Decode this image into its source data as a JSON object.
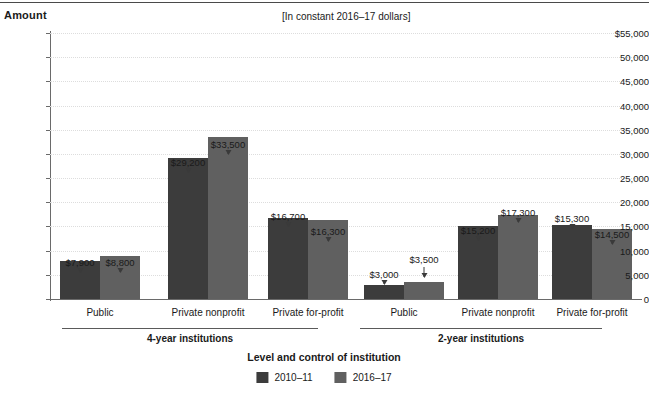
{
  "header": {
    "amount_label": "Amount",
    "units_note": "[In constant 2016–17 dollars]"
  },
  "axis_title": "Level and control of institution",
  "legend": {
    "items": [
      {
        "label": "2010–11",
        "color": "#3c3c3c"
      },
      {
        "label": "2016–17",
        "color": "#606060"
      }
    ]
  },
  "colors": {
    "series_2010_11": "#3c3c3c",
    "series_2016_17": "#606060",
    "axis": "#6a6a6a",
    "gridline": "#dddddd",
    "text": "#1a1a1a"
  },
  "chart_data": {
    "type": "bar",
    "title": "",
    "subtitle": "[In constant 2016–17 dollars]",
    "xlabel": "Level and control of institution",
    "ylabel": "Amount",
    "ylim": [
      0,
      55000
    ],
    "ytick_values": [
      0,
      5000,
      10000,
      15000,
      20000,
      25000,
      30000,
      35000,
      40000,
      45000,
      50000,
      55000
    ],
    "ytick_labels": [
      "0",
      "5,000",
      "10,000",
      "15,000",
      "20,000",
      "25,000",
      "30,000",
      "35,000",
      "40,000",
      "45,000",
      "50,000",
      "$55,000"
    ],
    "grid": true,
    "legend_position": "bottom",
    "categories": [
      "Public",
      "Private nonprofit",
      "Private for-profit",
      "Public",
      "Private nonprofit",
      "Private for-profit"
    ],
    "groups": [
      {
        "label": "4-year institutions",
        "categories": [
          "Public",
          "Private nonprofit",
          "Private for-profit"
        ]
      },
      {
        "label": "2-year institutions",
        "categories": [
          "Public",
          "Private nonprofit",
          "Private for-profit"
        ]
      }
    ],
    "series": [
      {
        "name": "2010–11",
        "values": [
          7900,
          29200,
          16700,
          3000,
          15200,
          15300
        ],
        "data_labels": [
          "$7,900",
          "$29,200",
          "$16,700",
          "$3,000",
          "$15,200",
          "$15,300"
        ]
      },
      {
        "name": "2016–17",
        "values": [
          8800,
          33500,
          16300,
          3500,
          17300,
          14500
        ],
        "data_labels": [
          "$8,800",
          "$33,500",
          "$16,300",
          "$3,500",
          "$17,300",
          "$14,500"
        ]
      }
    ]
  },
  "layout": {
    "plot": {
      "left": 50,
      "top": 33,
      "width": 592,
      "height": 266,
      "baseline": 299
    },
    "bar_width": 40,
    "pairs": [
      {
        "x0": 60,
        "x1": 100,
        "center": 100,
        "label_x": 100
      },
      {
        "x0": 168,
        "x1": 208,
        "center": 208,
        "label_x": 208
      },
      {
        "x0": 268,
        "x1": 308,
        "center": 308,
        "label_x": 308
      },
      {
        "x0": 364,
        "x1": 404,
        "center": 404,
        "label_x": 404
      },
      {
        "x0": 458,
        "x1": 498,
        "center": 498,
        "label_x": 498
      },
      {
        "x0": 552,
        "x1": 592,
        "center": 592,
        "label_x": 592
      }
    ],
    "label_tiers": [
      [
        224,
        224
      ],
      [
        124,
        106
      ],
      [
        178,
        193
      ],
      [
        236,
        221
      ],
      [
        192,
        174
      ],
      [
        180,
        196
      ]
    ],
    "group_rules": [
      {
        "left": 62,
        "width": 256,
        "top": 328,
        "label_x": 190,
        "label_y": 333
      },
      {
        "left": 360,
        "width": 242,
        "top": 328,
        "label_x": 481,
        "label_y": 333
      }
    ]
  }
}
